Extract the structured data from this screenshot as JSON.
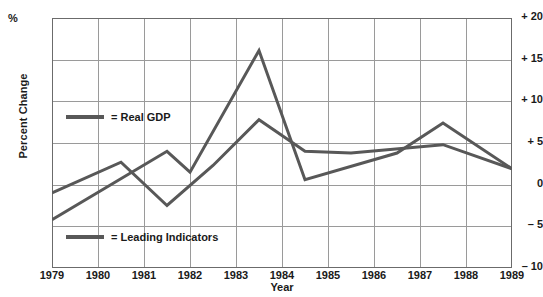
{
  "chart_data": {
    "type": "line",
    "title": "",
    "xlabel": "Year",
    "ylabel": "Percent Change",
    "unit_symbol": "%",
    "xlim": [
      1979,
      1989
    ],
    "ylim": [
      -10,
      20
    ],
    "grid": true,
    "legend_position": "inside-left",
    "ytick_labels": [
      "+ 20",
      "+ 15",
      "+ 10",
      "+ 5",
      "0",
      "– 5",
      "– 10"
    ],
    "ytick_values": [
      20,
      15,
      10,
      5,
      0,
      -5,
      -10
    ],
    "xtick_labels": [
      "1979",
      "1980",
      "1981",
      "1982",
      "1983",
      "1984",
      "1985",
      "1986",
      "1987",
      "1988",
      "1989"
    ],
    "xtick_values": [
      1979,
      1980,
      1981,
      1982,
      1983,
      1984,
      1985,
      1986,
      1987,
      1988,
      1989
    ],
    "series": [
      {
        "name": "Real GDP",
        "legend_label": "= Real GDP",
        "color": "#585858",
        "x": [
          1979,
          1980.5,
          1981.5,
          1982.5,
          1983.5,
          1984.5,
          1985.5,
          1987.5,
          1989
        ],
        "values": [
          -1.0,
          2.7,
          -2.5,
          2.3,
          7.8,
          4.0,
          3.8,
          4.8,
          1.9
        ]
      },
      {
        "name": "Leading Indicators",
        "legend_label": "= Leading Indicators",
        "color": "#585858",
        "x": [
          1979,
          1981.5,
          1982,
          1983.5,
          1984.5,
          1986.5,
          1987.5,
          1989
        ],
        "values": [
          -4.2,
          4.0,
          1.5,
          16.1,
          0.6,
          3.8,
          7.4,
          1.9
        ]
      }
    ]
  }
}
